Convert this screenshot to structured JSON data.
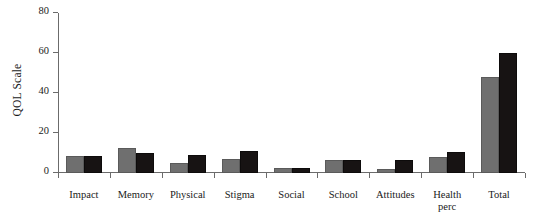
{
  "chart_data": {
    "type": "bar",
    "title": "",
    "xlabel": "",
    "ylabel": "QOL Scale",
    "ylim": [
      0,
      80
    ],
    "yticks": [
      0,
      20,
      40,
      60,
      80
    ],
    "grid": false,
    "legend": "none",
    "categories": [
      "Impact",
      "Memory",
      "Physical",
      "Stigma",
      "Social",
      "School",
      "Attitudes",
      "Health\nperc",
      "Total"
    ],
    "series": [
      {
        "name": "series-1",
        "color": "#6f6f6f",
        "values": [
          8.5,
          12.5,
          5,
          7,
          2.5,
          6.5,
          2,
          8,
          48
        ]
      },
      {
        "name": "series-2",
        "color": "#171313",
        "values": [
          8.5,
          10,
          9,
          11,
          2.5,
          6.5,
          6.5,
          10.5,
          60
        ]
      }
    ]
  },
  "axis": {
    "tick_labels": [
      "0",
      "20",
      "40",
      "60",
      "80"
    ]
  }
}
